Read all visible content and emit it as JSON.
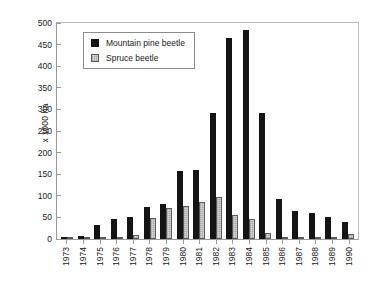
{
  "chart_data": {
    "type": "bar",
    "title": "",
    "xlabel": "",
    "ylabel": "x 1000 ha",
    "ylim": [
      0,
      500
    ],
    "yticks": [
      0,
      50,
      100,
      150,
      200,
      250,
      300,
      350,
      400,
      450,
      500
    ],
    "grid": false,
    "legend_position": "top-left-inside",
    "categories": [
      "1973",
      "1974",
      "1975",
      "1976",
      "1977",
      "1978",
      "1979",
      "1980",
      "1981",
      "1982",
      "1983",
      "1984",
      "1985",
      "1986",
      "1987",
      "1988",
      "1989",
      "1990"
    ],
    "series": [
      {
        "name": "Mountain pine beetle",
        "color": "#141414",
        "values": [
          4,
          6,
          31,
          45,
          51,
          74,
          81,
          155,
          158,
          289,
          460,
          479,
          290,
          92,
          64,
          60,
          51,
          39
        ]
      },
      {
        "name": "Spruce beetle",
        "color": "#dcdcdc",
        "values": [
          1,
          1,
          0,
          0,
          10,
          49,
          72,
          75,
          84,
          97,
          56,
          45,
          13,
          2,
          1,
          2,
          0,
          11
        ]
      }
    ]
  },
  "axis": {
    "y_title": "x 1000 ha"
  }
}
